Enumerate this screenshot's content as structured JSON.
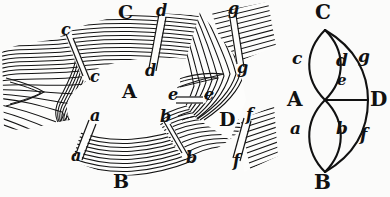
{
  "figure": {
    "background_color": "#fbfbfa",
    "ink_color": "#111111"
  },
  "left_panel": {
    "name": "fibrous-structure-illustration",
    "region_labels": [
      {
        "text": "A",
        "x": 122,
        "y": 92,
        "size": 19
      },
      {
        "text": "B",
        "x": 113,
        "y": 178,
        "size": 19
      },
      {
        "text": "C",
        "x": 118,
        "y": 10,
        "size": 19
      },
      {
        "text": "D",
        "x": 219,
        "y": 118,
        "size": 19
      }
    ],
    "cut_labels": [
      {
        "text": "c",
        "x": 61,
        "y": 30,
        "size": 16
      },
      {
        "text": "c",
        "x": 90,
        "y": 77,
        "size": 16
      },
      {
        "text": "d",
        "x": 156,
        "y": 11,
        "size": 16
      },
      {
        "text": "d",
        "x": 147,
        "y": 71,
        "size": 16
      },
      {
        "text": "g",
        "x": 228,
        "y": 8,
        "size": 16
      },
      {
        "text": "g",
        "x": 237,
        "y": 68,
        "size": 16
      },
      {
        "text": "e",
        "x": 170,
        "y": 95,
        "size": 16
      },
      {
        "text": "e",
        "x": 206,
        "y": 95,
        "size": 16
      },
      {
        "text": "a",
        "x": 90,
        "y": 115,
        "size": 16
      },
      {
        "text": "a",
        "x": 71,
        "y": 155,
        "size": 16
      },
      {
        "text": "b",
        "x": 160,
        "y": 117,
        "size": 16
      },
      {
        "text": "b",
        "x": 186,
        "y": 157,
        "size": 16
      },
      {
        "text": "f",
        "x": 245,
        "y": 115,
        "size": 16
      },
      {
        "text": "f",
        "x": 233,
        "y": 161,
        "size": 16
      }
    ]
  },
  "right_panel": {
    "name": "abstract-graph-diagram",
    "nodes": [
      {
        "id": "C",
        "label": "C",
        "cx": 325,
        "cy": 30,
        "label_x": 315,
        "label_y": 6,
        "size": 20
      },
      {
        "id": "A",
        "label": "A",
        "cx": 325,
        "cy": 100,
        "label_x": 288,
        "label_y": 90,
        "size": 20
      },
      {
        "id": "D",
        "label": "D",
        "cx": 368,
        "cy": 100,
        "label_x": 369,
        "label_y": 90,
        "size": 20
      },
      {
        "id": "B",
        "label": "B",
        "cx": 325,
        "cy": 172,
        "label_x": 314,
        "label_y": 174,
        "size": 20
      }
    ],
    "edges": [
      {
        "id": "c",
        "from": "A",
        "to": "C",
        "label": "c",
        "label_x": 293,
        "label_y": 57,
        "size": 17
      },
      {
        "id": "d",
        "from": "A",
        "to": "C",
        "label": "d",
        "label_x": 337,
        "label_y": 60,
        "size": 17
      },
      {
        "id": "g",
        "from": "C",
        "to": "D",
        "label": "g",
        "label_x": 358,
        "label_y": 55,
        "size": 17
      },
      {
        "id": "e",
        "from": "A",
        "to": "D",
        "label": "e",
        "label_x": 337,
        "label_y": 79,
        "size": 15
      },
      {
        "id": "a",
        "from": "A",
        "to": "B",
        "label": "a",
        "label_x": 291,
        "label_y": 126,
        "size": 17
      },
      {
        "id": "b",
        "from": "A",
        "to": "B",
        "label": "b",
        "label_x": 337,
        "label_y": 127,
        "size": 17
      },
      {
        "id": "f",
        "from": "B",
        "to": "D",
        "label": "f",
        "label_x": 360,
        "label_y": 132,
        "size": 17
      }
    ]
  }
}
